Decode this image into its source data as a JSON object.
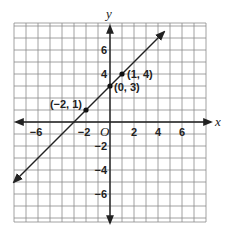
{
  "chart_data": {
    "type": "line",
    "title": "",
    "xlabel": "x",
    "ylabel": "y",
    "origin_label": "O",
    "xlim": [
      -8,
      8
    ],
    "ylim": [
      -8,
      8.3
    ],
    "grid": true,
    "grid_step": 1,
    "x_ticks": [
      -6,
      -2,
      2,
      4,
      6
    ],
    "x_tick_labels": [
      "−6",
      "−2",
      "2",
      "4",
      "6"
    ],
    "y_ticks": [
      6,
      4,
      -2,
      -4,
      -6
    ],
    "y_tick_labels": [
      "6",
      "4",
      "−2",
      "−4",
      "−6"
    ],
    "series": [
      {
        "name": "y = x + 3",
        "equation": "y = x + 3",
        "slope": 1,
        "intercept": 3,
        "x_range": [
          -8,
          4.5
        ],
        "arrows": "both",
        "points": [
          {
            "x": -2,
            "y": 1,
            "label": "(−2, 1)"
          },
          {
            "x": 0,
            "y": 3,
            "label": "(0, 3)"
          },
          {
            "x": 1,
            "y": 4,
            "label": "(1, 4)"
          }
        ]
      }
    ]
  }
}
